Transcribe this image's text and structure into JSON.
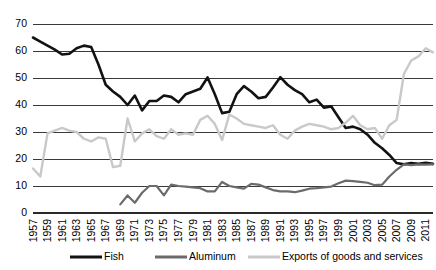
{
  "chart_data": {
    "type": "line",
    "title": "",
    "xlabel": "",
    "ylabel": "",
    "ylim": [
      0,
      70
    ],
    "ytick_step": 10,
    "yticks": [
      "0",
      "10",
      "20",
      "30",
      "40",
      "50",
      "60",
      "70"
    ],
    "xlim": [
      1957,
      2012
    ],
    "grid": true,
    "legend_position": "bottom",
    "xticks": [
      "1957",
      "1959",
      "1961",
      "1963",
      "1965",
      "1967",
      "1969",
      "1971",
      "1973",
      "1975",
      "1977",
      "1979",
      "1981",
      "1983",
      "1985",
      "1987",
      "1989",
      "1991",
      "1993",
      "1995",
      "1997",
      "1999",
      "2001",
      "2003",
      "2005",
      "2007",
      "2009",
      "2011"
    ],
    "x": [
      1957,
      1958,
      1959,
      1960,
      1961,
      1962,
      1963,
      1964,
      1965,
      1966,
      1967,
      1968,
      1969,
      1970,
      1971,
      1972,
      1973,
      1974,
      1975,
      1976,
      1977,
      1978,
      1979,
      1980,
      1981,
      1982,
      1983,
      1984,
      1985,
      1986,
      1987,
      1988,
      1989,
      1990,
      1991,
      1992,
      1993,
      1994,
      1995,
      1996,
      1997,
      1998,
      1999,
      2000,
      2001,
      2002,
      2003,
      2004,
      2005,
      2006,
      2007,
      2008,
      2009,
      2010,
      2011,
      2012
    ],
    "series": [
      {
        "name": "Fish",
        "color": "#121212",
        "width": 2.6,
        "x": [
          1957,
          1958,
          1959,
          1960,
          1961,
          1962,
          1963,
          1964,
          1965,
          1966,
          1967,
          1968,
          1969,
          1970,
          1971,
          1972,
          1973,
          1974,
          1975,
          1976,
          1977,
          1978,
          1979,
          1980,
          1981,
          1982,
          1983,
          1984,
          1985,
          1986,
          1987,
          1988,
          1989,
          1990,
          1991,
          1992,
          1993,
          1994,
          1995,
          1996,
          1997,
          1998,
          1999,
          2000,
          2001,
          2002,
          2003,
          2004,
          2005,
          2006,
          2007,
          2008,
          2009,
          2010,
          2011,
          2012
        ],
        "values": [
          65.0,
          63.5,
          62.0,
          60.5,
          58.7,
          59.0,
          61.0,
          62.0,
          61.5,
          55.0,
          47.5,
          45.0,
          43.0,
          40.0,
          43.5,
          38.0,
          41.5,
          41.5,
          43.5,
          43.0,
          41.0,
          44.0,
          45.0,
          46.0,
          50.2,
          44.0,
          37.0,
          37.5,
          44.0,
          47.0,
          45.0,
          42.5,
          43.0,
          46.5,
          50.3,
          47.5,
          45.5,
          44.0,
          41.0,
          42.0,
          39.0,
          39.5,
          35.5,
          31.5,
          32.0,
          31.0,
          29.0,
          26.0,
          24.0,
          21.5,
          18.5,
          18.0,
          18.5,
          18.2,
          18.6,
          18.2
        ]
      },
      {
        "name": "Aluminum",
        "color": "#6b6b6b",
        "width": 2.2,
        "x": [
          1969,
          1970,
          1971,
          1972,
          1973,
          1974,
          1975,
          1976,
          1977,
          1978,
          1979,
          1980,
          1981,
          1982,
          1983,
          1984,
          1985,
          1986,
          1987,
          1988,
          1989,
          1990,
          1991,
          1992,
          1993,
          1994,
          1995,
          1996,
          1997,
          1998,
          1999,
          2000,
          2001,
          2002,
          2003,
          2004,
          2005,
          2006,
          2007,
          2008,
          2009,
          2010,
          2011,
          2012
        ],
        "values": [
          3.2,
          6.5,
          3.8,
          7.5,
          10.0,
          10.0,
          6.5,
          10.5,
          10.0,
          9.8,
          9.5,
          9.2,
          8.0,
          8.0,
          11.5,
          10.0,
          9.5,
          9.0,
          10.8,
          10.5,
          9.5,
          8.5,
          8.0,
          8.0,
          7.7,
          8.3,
          9.0,
          9.2,
          9.5,
          9.8,
          11.0,
          12.0,
          11.8,
          11.5,
          11.2,
          10.3,
          10.5,
          13.5,
          16.0,
          18.0,
          17.7,
          18.0,
          17.9,
          18.0
        ]
      },
      {
        "name": "Exports of goods and services",
        "color": "#c9c9c9",
        "width": 2.4,
        "x": [
          1957,
          1958,
          1959,
          1960,
          1961,
          1962,
          1963,
          1964,
          1965,
          1966,
          1967,
          1968,
          1969,
          1970,
          1971,
          1972,
          1973,
          1974,
          1975,
          1976,
          1977,
          1978,
          1979,
          1980,
          1981,
          1982,
          1983,
          1984,
          1985,
          1986,
          1987,
          1988,
          1989,
          1990,
          1991,
          1992,
          1993,
          1994,
          1995,
          1996,
          1997,
          1998,
          1999,
          2000,
          2001,
          2002,
          2003,
          2004,
          2005,
          2006,
          2007,
          2008,
          2009,
          2010,
          2011,
          2012
        ],
        "values": [
          16.5,
          13.5,
          29.5,
          30.5,
          31.5,
          30.5,
          30.0,
          27.5,
          26.5,
          28.0,
          27.5,
          17.0,
          17.5,
          35.0,
          26.5,
          29.5,
          31.0,
          28.5,
          27.5,
          31.0,
          29.0,
          29.5,
          29.0,
          34.5,
          36.0,
          33.0,
          27.0,
          36.5,
          35.0,
          33.0,
          32.5,
          32.0,
          31.5,
          32.5,
          29.0,
          27.5,
          30.5,
          32.0,
          33.0,
          32.5,
          32.0,
          31.0,
          31.5,
          33.5,
          36.0,
          32.5,
          31.0,
          31.5,
          27.5,
          32.5,
          34.5,
          51.5,
          56.5,
          58.0,
          61.0,
          59.5
        ]
      }
    ],
    "legend": [
      {
        "label": "Fish",
        "color": "#121212"
      },
      {
        "label": "Aluminum",
        "color": "#6b6b6b"
      },
      {
        "label": "Exports of goods and services",
        "color": "#c9c9c9"
      }
    ]
  }
}
